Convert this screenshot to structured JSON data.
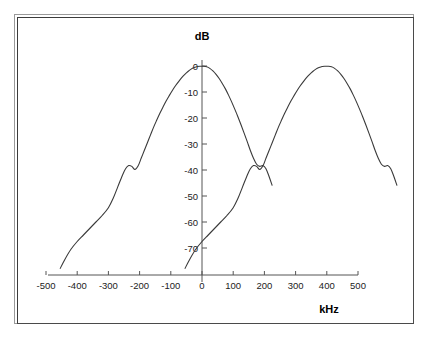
{
  "figure": {
    "frame": {
      "outer_border_color": "#9a9a9a",
      "inner_border_color": "#4a4a4a",
      "background": "#ffffff"
    },
    "curve_color": "#3a3a3a",
    "axis_color": "#555555"
  },
  "chart_data": {
    "type": "line",
    "title": "",
    "subtitle": "",
    "xlabel": "kHz",
    "ylabel": "dB",
    "xlim": [
      -560,
      580
    ],
    "ylim": [
      -80,
      3
    ],
    "grid": false,
    "legend": null,
    "x_ticks": [
      -500,
      -400,
      -300,
      -200,
      -100,
      0,
      100,
      200,
      300,
      400,
      500
    ],
    "x_tick_labels": [
      "-500",
      "-400",
      "-300",
      "-200",
      "-100",
      "0",
      "100",
      "200",
      "300",
      "400",
      "500"
    ],
    "y_ticks": [
      0,
      -10,
      -20,
      -30,
      -40,
      -50,
      -60,
      -70
    ],
    "y_tick_labels": [
      "0",
      "-10",
      "-20",
      "-30",
      "-40",
      "-50",
      "-60",
      "-70"
    ],
    "series": [
      {
        "name": "channel-centered-spectrum",
        "center_khz": 0,
        "peak_db": 0,
        "x": [
          -455,
          -440,
          -420,
          -400,
          -380,
          -360,
          -340,
          -320,
          -300,
          -285,
          -270,
          -255,
          -245,
          -235,
          -225,
          -215,
          -205,
          -195,
          -185,
          -175,
          -165,
          -155,
          -145,
          -135,
          -125,
          -115,
          -105,
          -95,
          -85,
          -75,
          -65,
          -55,
          -45,
          -35,
          -25,
          -15,
          -5,
          5,
          15,
          25,
          35,
          45,
          55,
          65,
          75,
          85,
          95,
          105,
          115,
          125,
          135,
          145,
          155,
          165,
          175,
          185,
          195,
          205,
          215,
          225
        ],
        "y": [
          -78,
          -74.5,
          -70.5,
          -67.5,
          -65,
          -62.5,
          -60,
          -57.5,
          -54.5,
          -51,
          -46.5,
          -42,
          -39.5,
          -38.3,
          -38.6,
          -39.8,
          -38.5,
          -35.5,
          -32.5,
          -29.5,
          -26.5,
          -23.5,
          -20.8,
          -18.2,
          -15.8,
          -13.5,
          -11.4,
          -9.4,
          -7.6,
          -6,
          -4.5,
          -3.2,
          -2.1,
          -1.2,
          -0.6,
          -0.2,
          -0.1,
          -0.1,
          -0.3,
          -0.9,
          -1.9,
          -3.2,
          -4.8,
          -6.7,
          -8.8,
          -11.2,
          -13.8,
          -16.6,
          -19.5,
          -22.6,
          -25.8,
          -29.1,
          -32.5,
          -35.5,
          -37.8,
          -38.6,
          -38.3,
          -39.5,
          -42.5,
          -46
        ]
      },
      {
        "name": "adjacent-channel-spectrum",
        "center_khz": 200,
        "peak_db": 0,
        "offset_khz": 200,
        "x": [
          -255,
          -240,
          -220,
          -200,
          -180,
          -160,
          -140,
          -120,
          -100,
          -85,
          -70,
          -55,
          -45,
          -35,
          -25,
          -15,
          -5,
          5,
          15,
          25,
          35,
          45,
          55,
          65,
          75,
          85,
          95,
          105,
          115,
          125,
          135,
          145,
          155,
          165,
          175,
          185,
          195,
          205,
          215,
          225,
          235,
          245,
          255,
          265,
          275,
          285,
          295,
          305,
          315,
          325,
          335,
          345,
          355,
          365,
          375,
          385,
          395,
          405,
          415,
          425
        ],
        "y": [
          -78,
          -74.5,
          -70.5,
          -67.5,
          -65,
          -62.5,
          -60,
          -57.5,
          -54.5,
          -51,
          -46.5,
          -42,
          -39.5,
          -38.3,
          -38.6,
          -39.8,
          -38.5,
          -35.5,
          -32.5,
          -29.5,
          -26.5,
          -23.5,
          -20.8,
          -18.2,
          -15.8,
          -13.5,
          -11.4,
          -9.4,
          -7.6,
          -6,
          -4.5,
          -3.2,
          -2.1,
          -1.2,
          -0.6,
          -0.2,
          -0.1,
          -0.1,
          -0.3,
          -0.9,
          -1.9,
          -3.2,
          -4.8,
          -6.7,
          -8.8,
          -11.2,
          -13.8,
          -16.6,
          -19.5,
          -22.6,
          -25.8,
          -29.1,
          -32.5,
          -35.5,
          -37.8,
          -38.6,
          -38.3,
          -39.5,
          -42.5,
          -46
        ]
      }
    ],
    "annotations": []
  }
}
